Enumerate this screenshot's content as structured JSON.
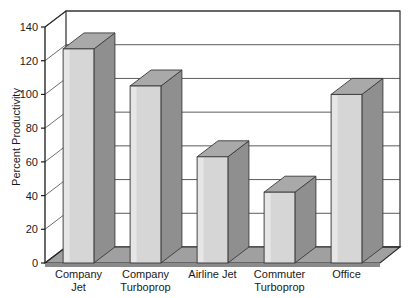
{
  "chart_data": {
    "type": "bar",
    "title": "",
    "xlabel": "",
    "ylabel": "Percent Productivity",
    "categories": [
      "Company Jet",
      "Company Turboprop",
      "Airline Jet",
      "Commuter Turboprop",
      "Office"
    ],
    "category_lines": [
      [
        "Company",
        "Jet"
      ],
      [
        "Company",
        "Turboprop"
      ],
      [
        "Airline Jet",
        ""
      ],
      [
        "Commuter",
        "Turboprop"
      ],
      [
        "Office",
        ""
      ]
    ],
    "values": [
      127,
      105,
      63,
      42,
      100
    ],
    "ylim": [
      0,
      140
    ],
    "ytick_step": 20,
    "yticks": [
      "0",
      "20",
      "40",
      "60",
      "80",
      "100",
      "120",
      "140"
    ],
    "ytick_values": [
      0,
      20,
      40,
      60,
      80,
      100,
      120,
      140
    ],
    "grid": true,
    "legend": "none",
    "three_d": true,
    "colors": {
      "bar_front": "#d6d6d6",
      "bar_top": "#a9a9a9",
      "bar_side": "#8f8f8f",
      "bar_outline": "#3a3a3a",
      "floor": "#a0a0a0",
      "floor_front": "#8a8a8a",
      "wall": "#ffffff",
      "gridline": "#4a4a4a",
      "axis": "#1a1a1a",
      "text": "#1a1a1a"
    }
  }
}
